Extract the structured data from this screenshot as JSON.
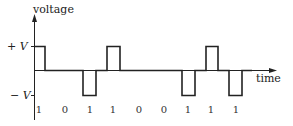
{
  "diagram": {
    "y_axis_label": "voltage",
    "x_axis_label": "time",
    "levels": {
      "plus": "+ V",
      "minus": "− V"
    },
    "bits": [
      "1",
      "0",
      "1",
      "1",
      "0",
      "0",
      "1",
      "1",
      "1"
    ],
    "signal_levels": [
      1,
      0,
      -1,
      1,
      0,
      0,
      -1,
      1,
      -1
    ],
    "line_color": "#222222"
  }
}
